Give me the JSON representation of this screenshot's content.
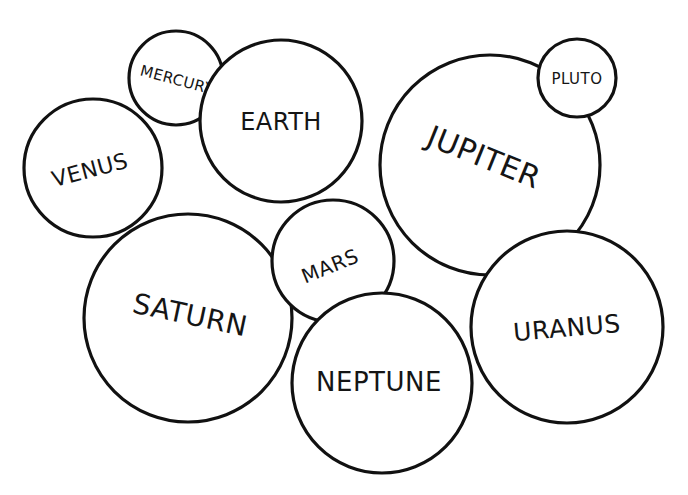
{
  "diagram": {
    "background": "#ffffff",
    "stroke_color": "#111111",
    "text_color": "#151515",
    "planets": [
      {
        "id": "mercury",
        "label": "MERCURY",
        "cx": 176,
        "cy": 78,
        "r": 47,
        "label_x": 177,
        "label_y": 80,
        "font_size": 15,
        "rotate": 15
      },
      {
        "id": "earth",
        "label": "EARTH",
        "cx": 281,
        "cy": 121,
        "r": 81,
        "label_x": 281,
        "label_y": 122,
        "font_size": 24,
        "rotate": 0
      },
      {
        "id": "venus",
        "label": "VENUS",
        "cx": 93,
        "cy": 168,
        "r": 69,
        "label_x": 90,
        "label_y": 170,
        "font_size": 22,
        "rotate": -15
      },
      {
        "id": "pluto",
        "label": "PLUTO",
        "cx": 577,
        "cy": 78,
        "r": 39,
        "label_x": 577,
        "label_y": 79,
        "font_size": 15,
        "rotate": 0
      },
      {
        "id": "jupiter",
        "label": "JUPITER",
        "cx": 490,
        "cy": 165,
        "r": 110,
        "label_x": 484,
        "label_y": 157,
        "font_size": 30,
        "rotate": 22
      },
      {
        "id": "saturn",
        "label": "SATURN",
        "cx": 188,
        "cy": 318,
        "r": 104,
        "label_x": 190,
        "label_y": 315,
        "font_size": 28,
        "rotate": 12
      },
      {
        "id": "mars",
        "label": "MARS",
        "cx": 333,
        "cy": 261,
        "r": 61,
        "label_x": 330,
        "label_y": 266,
        "font_size": 20,
        "rotate": -22
      },
      {
        "id": "neptune",
        "label": "NEPTUNE",
        "cx": 382,
        "cy": 383,
        "r": 90,
        "label_x": 379,
        "label_y": 382,
        "font_size": 26,
        "rotate": 0
      },
      {
        "id": "uranus",
        "label": "URANUS",
        "cx": 567,
        "cy": 327,
        "r": 96,
        "label_x": 567,
        "label_y": 328,
        "font_size": 25,
        "rotate": -5
      }
    ]
  }
}
